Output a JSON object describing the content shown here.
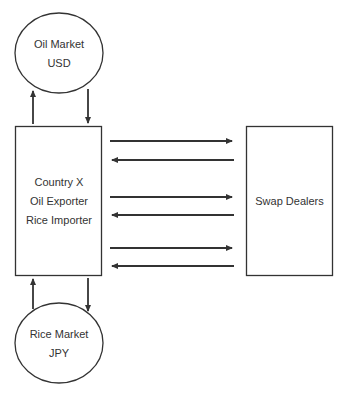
{
  "diagram": {
    "nodes": {
      "oil_market": {
        "line1": "Oil Market",
        "line2": "USD",
        "shape": "ellipse"
      },
      "country_x": {
        "line1": "Country X",
        "line2": "Oil Exporter",
        "line3": "Rice Importer",
        "shape": "rectangle"
      },
      "rice_market": {
        "line1": "Rice Market",
        "line2": "JPY",
        "shape": "ellipse"
      },
      "swap_dealers": {
        "label": "Swap Dealers",
        "shape": "rectangle"
      }
    },
    "edges": [
      {
        "from": "country_x",
        "to": "oil_market"
      },
      {
        "from": "oil_market",
        "to": "country_x"
      },
      {
        "from": "country_x",
        "to": "rice_market"
      },
      {
        "from": "rice_market",
        "to": "country_x"
      },
      {
        "from": "country_x",
        "to": "swap_dealers"
      },
      {
        "from": "swap_dealers",
        "to": "country_x"
      },
      {
        "from": "country_x",
        "to": "swap_dealers"
      },
      {
        "from": "swap_dealers",
        "to": "country_x"
      },
      {
        "from": "country_x",
        "to": "swap_dealers"
      },
      {
        "from": "swap_dealers",
        "to": "country_x"
      }
    ],
    "colors": {
      "stroke": "#333333",
      "text": "#333333",
      "background": "#ffffff"
    }
  }
}
